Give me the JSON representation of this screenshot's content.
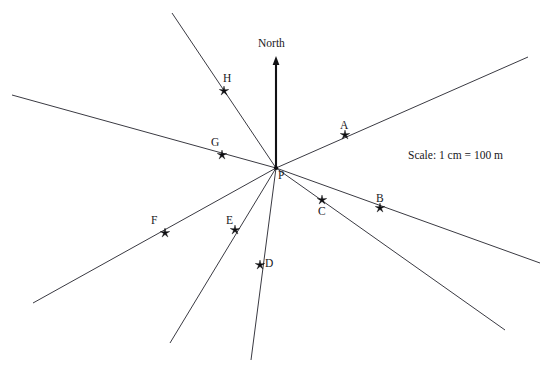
{
  "diagram": {
    "title_text": "North",
    "scale_note": "Scale: 1 cm = 100 m",
    "origin_label": "P",
    "colors": {
      "line": "#3a3a42",
      "north_arrow": "#111114",
      "marker": "#0d0d10",
      "text": "#17171b",
      "background": "#ffffff"
    }
  },
  "chart_data": {
    "type": "scatter",
    "title": "",
    "subtitle": "",
    "xlabel": "",
    "ylabel": "",
    "grid": false,
    "legend": "none",
    "annotations": [
      "North",
      "Scale: 1 cm = 100 m"
    ],
    "origin": {
      "label": "P",
      "x": 276,
      "y": 168
    },
    "north_arrow": {
      "from_x": 276,
      "from_y": 168,
      "to_x": 276,
      "to_y": 56
    },
    "points": [
      {
        "label": "A",
        "x": 345,
        "y": 135,
        "label_x": 340,
        "label_y": 120
      },
      {
        "label": "B",
        "x": 380,
        "y": 208,
        "label_x": 376,
        "label_y": 193
      },
      {
        "label": "C",
        "x": 322,
        "y": 200,
        "label_x": 318,
        "label_y": 206
      },
      {
        "label": "D",
        "x": 260,
        "y": 265,
        "label_x": 265,
        "label_y": 258
      },
      {
        "label": "E",
        "x": 235,
        "y": 230,
        "label_x": 226,
        "label_y": 215
      },
      {
        "label": "F",
        "x": 165,
        "y": 233,
        "label_x": 151,
        "label_y": 215
      },
      {
        "label": "G",
        "x": 222,
        "y": 155,
        "label_x": 211,
        "label_y": 137
      },
      {
        "label": "H",
        "x": 224,
        "y": 91,
        "label_x": 223,
        "label_y": 73
      }
    ],
    "rays": [
      {
        "name": "ray-A",
        "through": "A",
        "x1": 276,
        "y1": 168,
        "x2": 528,
        "y2": 57
      },
      {
        "name": "ray-B",
        "through": "B",
        "x1": 276,
        "y1": 168,
        "x2": 540,
        "y2": 263
      },
      {
        "name": "ray-C",
        "through": "C",
        "x1": 276,
        "y1": 168,
        "x2": 505,
        "y2": 330
      },
      {
        "name": "ray-D",
        "through": "D",
        "x1": 276,
        "y1": 168,
        "x2": 251,
        "y2": 360
      },
      {
        "name": "ray-E",
        "through": "E",
        "x1": 276,
        "y1": 168,
        "x2": 170,
        "y2": 343
      },
      {
        "name": "ray-F",
        "through": "F",
        "x1": 276,
        "y1": 168,
        "x2": 33,
        "y2": 303
      },
      {
        "name": "ray-G",
        "through": "G",
        "x1": 276,
        "y1": 168,
        "x2": 12,
        "y2": 95
      },
      {
        "name": "ray-H",
        "through": "H",
        "x1": 276,
        "y1": 168,
        "x2": 172,
        "y2": 13
      }
    ],
    "xlim": [
      0,
      552
    ],
    "ylim": [
      0,
      365
    ]
  }
}
